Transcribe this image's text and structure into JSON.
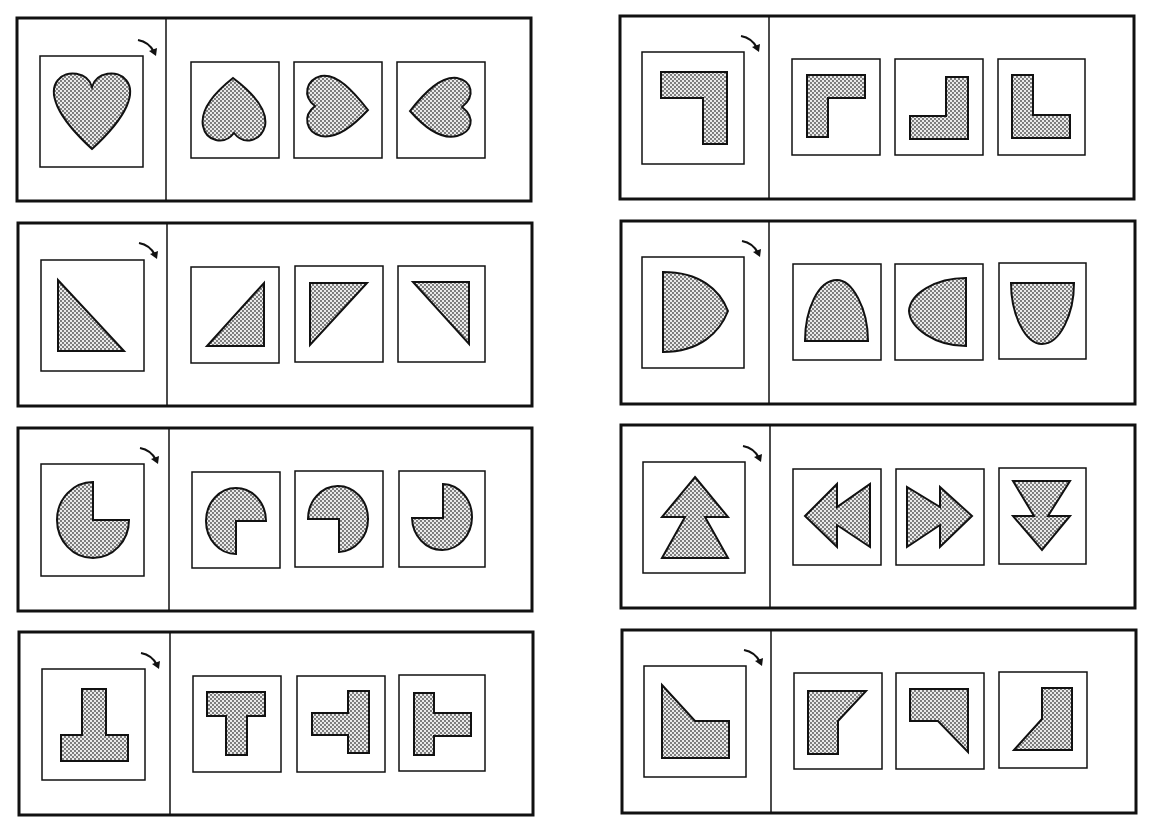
{
  "worksheet": {
    "title": "Mental rotation exercises",
    "instruction_arrow": "clockwise-rotation-arrow",
    "colors": {
      "stroke": "#111111",
      "fill_dots": "#555555",
      "fill_bg": "#e8e8e8",
      "paper": "#ffffff"
    },
    "puzzles": [
      {
        "id": 1,
        "column": "left",
        "row": 1,
        "shape": "heart",
        "choices": [
          "heart-rotated-180",
          "heart-rotated-90-cw",
          "heart-rotated-90-ccw"
        ]
      },
      {
        "id": 2,
        "column": "left",
        "row": 2,
        "shape": "right-triangle",
        "choices": [
          "triangle-right-angle-bottom-right",
          "triangle-right-angle-top-left",
          "triangle-right-angle-top-right"
        ]
      },
      {
        "id": 3,
        "column": "left",
        "row": 3,
        "shape": "pac-circle-notch-top-right",
        "choices": [
          "notch-bottom-right",
          "notch-bottom-left",
          "notch-top-left"
        ]
      },
      {
        "id": 4,
        "column": "left",
        "row": 4,
        "shape": "inverted-t",
        "choices": [
          "t-upright",
          "t-pointing-left",
          "t-pointing-right"
        ]
      },
      {
        "id": 5,
        "column": "right",
        "row": 1,
        "shape": "l-corner-top-right",
        "choices": [
          "l-corner-top-left",
          "l-corner-bottom-right",
          "l-corner-bottom-left"
        ]
      },
      {
        "id": 6,
        "column": "right",
        "row": 2,
        "shape": "half-dome-pointing-right",
        "choices": [
          "dome-pointing-up",
          "dome-pointing-left",
          "dome-pointing-down"
        ]
      },
      {
        "id": 7,
        "column": "right",
        "row": 3,
        "shape": "double-arrow-up",
        "choices": [
          "double-arrow-left",
          "double-arrow-right",
          "double-arrow-down"
        ]
      },
      {
        "id": 8,
        "column": "right",
        "row": 4,
        "shape": "chamfered-block",
        "choices": [
          "chamfer-top-right",
          "chamfer-bottom-right",
          "chamfer-bottom-left"
        ]
      }
    ]
  }
}
